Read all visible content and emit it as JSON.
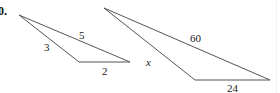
{
  "problem": {
    "number": "0."
  },
  "triangle_small": {
    "vertices": [
      [
        19,
        15
      ],
      [
        79,
        62
      ],
      [
        130,
        62
      ]
    ],
    "sides": [
      {
        "label": "3",
        "x": 44,
        "y": 51
      },
      {
        "label": "5",
        "x": 79,
        "y": 39
      },
      {
        "label": "2",
        "x": 102,
        "y": 75
      }
    ]
  },
  "triangle_large": {
    "vertices": [
      [
        104,
        8
      ],
      [
        195,
        80
      ],
      [
        270,
        80
      ]
    ],
    "sides": [
      {
        "label": "60",
        "x": 190,
        "y": 42
      },
      {
        "label": "x",
        "x": 146,
        "y": 66,
        "italic": true
      },
      {
        "label": "24",
        "x": 227,
        "y": 92
      }
    ]
  },
  "colors": {
    "stroke": "#555555",
    "text": "#222222"
  }
}
